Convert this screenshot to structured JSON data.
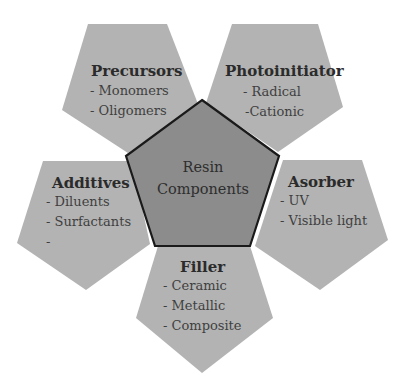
{
  "diagram": {
    "center": {
      "line1": "Resin",
      "line2": "Components"
    },
    "components": [
      {
        "id": "precursors",
        "title": "Precursors",
        "items": [
          "- Monomers",
          "- Oligomers"
        ]
      },
      {
        "id": "photoinitiator",
        "title": "Photoinitiator",
        "items": [
          "- Radical",
          "-Cationic"
        ]
      },
      {
        "id": "additives",
        "title": "Additives",
        "items": [
          "- Diluents",
          "- Surfactants",
          "-"
        ]
      },
      {
        "id": "asorber",
        "title": "Asorber",
        "items": [
          "- UV",
          "- Visible light"
        ]
      },
      {
        "id": "filler",
        "title": "Filler",
        "items": [
          "- Ceramic",
          "- Metallic",
          "- Composite"
        ]
      }
    ],
    "colors": {
      "petal_fill": "#b3b3b3",
      "core_fill": "#8c8c8c",
      "core_stroke": "#1a1a1a",
      "text": "#3d3d3d",
      "background": "#ffffff"
    }
  }
}
